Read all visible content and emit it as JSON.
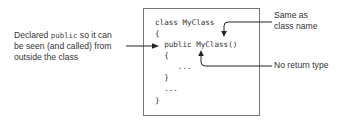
{
  "diagram": {
    "left_annotation": {
      "line1_pre": "Declared ",
      "line1_code": "public",
      "line1_post": " so it can",
      "line2": "be seen (and called) from",
      "line3": "outside the class"
    },
    "right_annotations": {
      "same_as_line1": "Same as",
      "same_as_line2": "class name",
      "no_return": "No return type"
    },
    "code": {
      "lines": [
        "class MyClass",
        "{",
        "  public MyClass()",
        "  {",
        "     ...",
        "  }",
        "  ...",
        "}"
      ]
    },
    "colors": {
      "text": "#333333",
      "arrow": "#222222",
      "box_border": "#777777"
    }
  }
}
